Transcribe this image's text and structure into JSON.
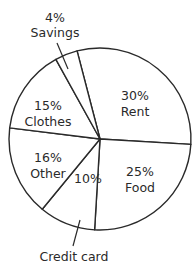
{
  "chart_data": {
    "type": "pie",
    "title": "",
    "unit": "%",
    "start_angle_deg": -14.6,
    "direction": "clockwise",
    "slices": [
      {
        "label": "Rent",
        "value": 30,
        "pct_text": "30%"
      },
      {
        "label": "Food",
        "value": 25,
        "pct_text": "25%"
      },
      {
        "label": "Credit card",
        "value": 10,
        "pct_text": "10%"
      },
      {
        "label": "Other",
        "value": 16,
        "pct_text": "16%"
      },
      {
        "label": "Clothes",
        "value": 15,
        "pct_text": "15%"
      },
      {
        "label": "Savings",
        "value": 4,
        "pct_text": "4%"
      }
    ],
    "fill_color": "#ffffff",
    "stroke_color": "#2a2a2a",
    "legend": "none",
    "external_labels": [
      "Savings",
      "Credit card"
    ]
  }
}
